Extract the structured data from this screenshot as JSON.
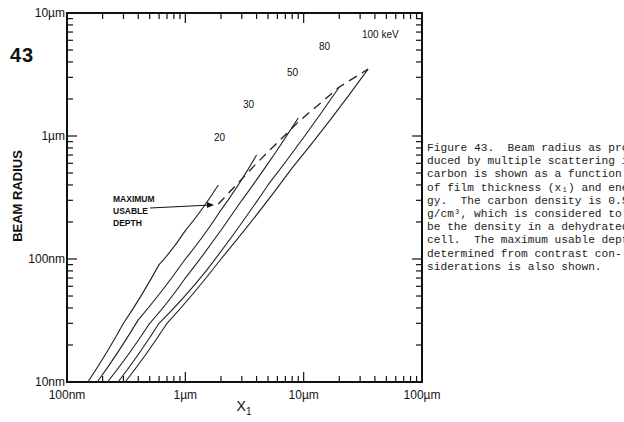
{
  "figure_number": "43",
  "caption": {
    "lines": [
      "Figure 43.  Beam radius as pro-",
      "duced by multiple scattering in",
      "carbon is shown as a function",
      "of film thickness (x₁) and ener-",
      "gy.  The carbon density is 0.5",
      "g/cm³, which is considered to",
      "be the density in a dehydrated",
      "cell.  The maximum usable depth,",
      "determined from contrast con-",
      "siderations is also shown."
    ]
  },
  "annotation": {
    "lines": [
      "MAXIMUM",
      "USABLE",
      "DEPTH"
    ]
  },
  "chart_data": {
    "type": "line",
    "title": "",
    "xlabel": "X1",
    "ylabel": "BEAM RADIUS",
    "xscale": "log",
    "yscale": "log",
    "xlim": [
      "100nm",
      "100µm"
    ],
    "ylim": [
      "10nm",
      "10µm"
    ],
    "x_tick_labels": [
      "100nm",
      "1µm",
      "10µm",
      "100µm"
    ],
    "y_tick_labels": [
      "10nm",
      "100nm",
      "1µm",
      "10µm"
    ],
    "grid": false,
    "units": "x and y in µm",
    "series": [
      {
        "name": "20 keV",
        "label": "20",
        "x": [
          0.15,
          0.3,
          0.6,
          1.0,
          1.9
        ],
        "y": [
          0.01,
          0.03,
          0.09,
          0.17,
          0.4
        ]
      },
      {
        "name": "30 keV",
        "label": "30",
        "x": [
          0.18,
          0.4,
          1.0,
          2.0,
          4.0
        ],
        "y": [
          0.01,
          0.032,
          0.1,
          0.25,
          0.7
        ]
      },
      {
        "name": "50 keV",
        "label": "50",
        "x": [
          0.22,
          0.5,
          1.0,
          3.0,
          9.0
        ],
        "y": [
          0.01,
          0.03,
          0.07,
          0.3,
          1.4
        ]
      },
      {
        "name": "80 keV",
        "label": "80",
        "x": [
          0.27,
          0.6,
          1.5,
          5.0,
          20.0
        ],
        "y": [
          0.01,
          0.03,
          0.08,
          0.4,
          2.5
        ]
      },
      {
        "name": "100 keV",
        "label": "100 keV",
        "x": [
          0.31,
          0.7,
          2.0,
          8.0,
          35.0
        ],
        "y": [
          0.01,
          0.03,
          0.1,
          0.55,
          3.5
        ]
      },
      {
        "name": "Maximum usable depth",
        "label": "MAXIMUM USABLE DEPTH",
        "style": "dashed",
        "x": [
          1.9,
          4.0,
          9.0,
          20.0,
          35.0
        ],
        "y": [
          0.28,
          0.6,
          1.3,
          2.5,
          3.5
        ]
      }
    ],
    "curve_labels": [
      "20",
      "30",
      "50",
      "80",
      "100 keV"
    ]
  }
}
